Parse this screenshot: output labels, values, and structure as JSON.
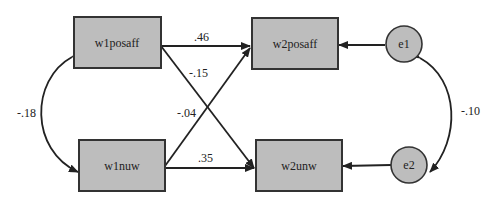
{
  "diagram": {
    "type": "path-diagram",
    "nodes": [
      {
        "id": "w1posaff",
        "label": "w1posaff",
        "shape": "rect"
      },
      {
        "id": "w1nuw",
        "label": "w1nuw",
        "shape": "rect"
      },
      {
        "id": "w2posaff",
        "label": "w2posaff",
        "shape": "rect"
      },
      {
        "id": "w2unw",
        "label": "w2unw",
        "shape": "rect"
      },
      {
        "id": "e1",
        "label": "e1",
        "shape": "circle"
      },
      {
        "id": "e2",
        "label": "e2",
        "shape": "circle"
      }
    ],
    "edges": [
      {
        "from": "w1posaff",
        "to": "w2posaff",
        "label": ".46"
      },
      {
        "from": "w1posaff",
        "to": "w2unw",
        "label": "-.15"
      },
      {
        "from": "w1nuw",
        "to": "w2posaff",
        "label": "-.04"
      },
      {
        "from": "w1nuw",
        "to": "w2unw",
        "label": ".35"
      },
      {
        "from": "e1",
        "to": "w2posaff",
        "label": ""
      },
      {
        "from": "e2",
        "to": "w2unw",
        "label": ""
      },
      {
        "from": "w1posaff",
        "to": "w1nuw",
        "label": "-.18",
        "bidirectional": true
      },
      {
        "from": "e1",
        "to": "e2",
        "label": "-.10",
        "bidirectional": true
      }
    ],
    "colors": {
      "node_fill": "#bdbdbd",
      "stroke": "#333333"
    }
  }
}
